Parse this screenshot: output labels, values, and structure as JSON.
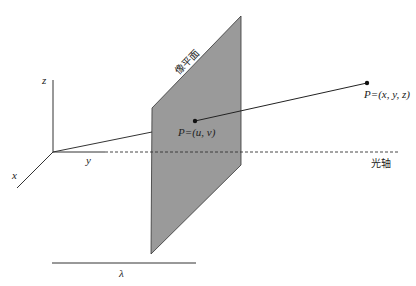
{
  "diagram": {
    "labels": {
      "z_axis": "z",
      "y_axis": "y",
      "x_axis": "x",
      "image_plane": "像平面",
      "image_point": "P=(u, v)",
      "world_point": "P=(x, y, z)",
      "optical_axis": "光轴",
      "focal_length": "λ"
    },
    "colors": {
      "plane_fill": "#9a9a9a",
      "line": "#222222",
      "background": "#ffffff"
    }
  }
}
